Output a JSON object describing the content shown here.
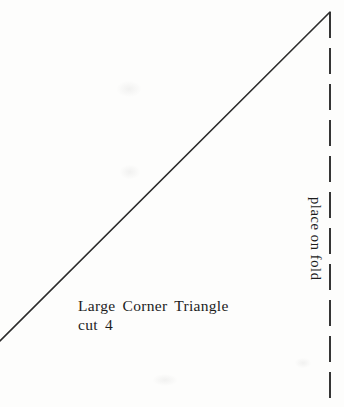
{
  "pattern": {
    "piece_name": "Large Corner Triangle",
    "cut_instruction": "cut 4",
    "fold_label": "place on fold"
  },
  "colors": {
    "paper": "#fdfdfc",
    "line": "#2c2c2c",
    "text": "#1c1c1c"
  },
  "drawing": {
    "width": 344,
    "height": 407,
    "diagonal_cut_line": {
      "x1": 0,
      "y1": 341,
      "x2": 330,
      "y2": 12,
      "stroke_width": 1.6
    },
    "fold_line": {
      "x1": 330,
      "y1": 12,
      "x2": 330,
      "y2": 407,
      "stroke_width": 1.9,
      "dash": "26 10"
    }
  }
}
